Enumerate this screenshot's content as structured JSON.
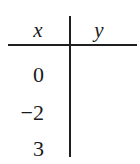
{
  "table": {
    "headers": {
      "x": "x",
      "y": "y"
    },
    "rows": [
      {
        "x": "0",
        "y": ""
      },
      {
        "x": "−2",
        "y": ""
      },
      {
        "x": "3",
        "y": ""
      }
    ]
  },
  "colors": {
    "ink": "#1f1f1f",
    "background": "#ffffff"
  }
}
